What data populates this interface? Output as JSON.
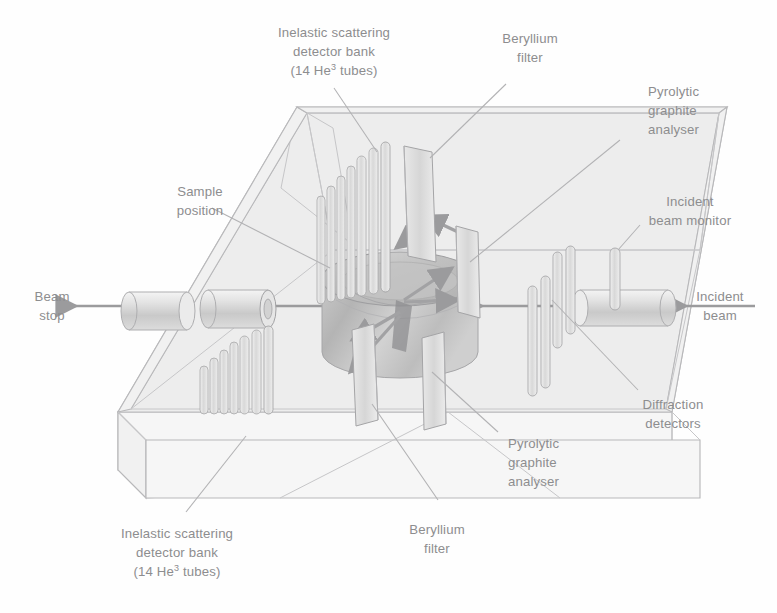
{
  "figure": {
    "background_color": "#ffffff",
    "ink_color": "#8d8d8f",
    "line_color": "#b8b8ba"
  },
  "labels": {
    "inelastic_top": {
      "line1": "Inelastic scattering",
      "line2": "detector bank",
      "line3_pre": "(14 He",
      "line3_sup": "3",
      "line3_post": " tubes)"
    },
    "beryllium_top": {
      "line1": "Beryllium",
      "line2": "filter"
    },
    "pyrolytic_top": {
      "line1": "Pyrolytic",
      "line2": "graphite",
      "line3": "analyser"
    },
    "incident_monitor": {
      "line1": "Incident",
      "line2": "beam monitor"
    },
    "incident_beam": {
      "line1": "Incident",
      "line2": "beam"
    },
    "diffraction": {
      "line1": "Diffraction",
      "line2": "detectors"
    },
    "pyrolytic_bottom": {
      "line1": "Pyrolytic",
      "line2": "graphite",
      "line3": "analyser"
    },
    "beryllium_bottom": {
      "line1": "Beryllium",
      "line2": "filter"
    },
    "inelastic_bottom": {
      "line1": "Inelastic scattering",
      "line2": "detector bank",
      "line3_pre": "(14 He",
      "line3_sup": "3",
      "line3_post": " tubes)"
    },
    "sample_position": {
      "line1": "Sample",
      "line2": "position"
    },
    "beam_stop": {
      "line1": "Beam",
      "line2": "stop"
    }
  },
  "components": {
    "vacuum_tank": "vacuum-tank",
    "sample": "sample-cylinder",
    "beam_stop_cylinder_outer": "beam-stop-cylinder-outer",
    "beam_stop_cylinder_inner": "beam-stop-cylinder-inner",
    "incident_beam_tube": "incident-beam-tube",
    "analyser_plate_upper": "pyrolytic-graphite-analyser-upper",
    "analyser_plate_lower": "pyrolytic-graphite-analyser-lower",
    "beryllium_filter_upper": "beryllium-filter-upper",
    "beryllium_filter_lower": "beryllium-filter-lower",
    "detector_bank_upper": "inelastic-detector-bank-upper",
    "detector_bank_lower": "inelastic-detector-bank-lower",
    "diffraction_detectors": "diffraction-detector-tubes",
    "incident_beam_monitor": "incident-beam-monitor-tube"
  }
}
